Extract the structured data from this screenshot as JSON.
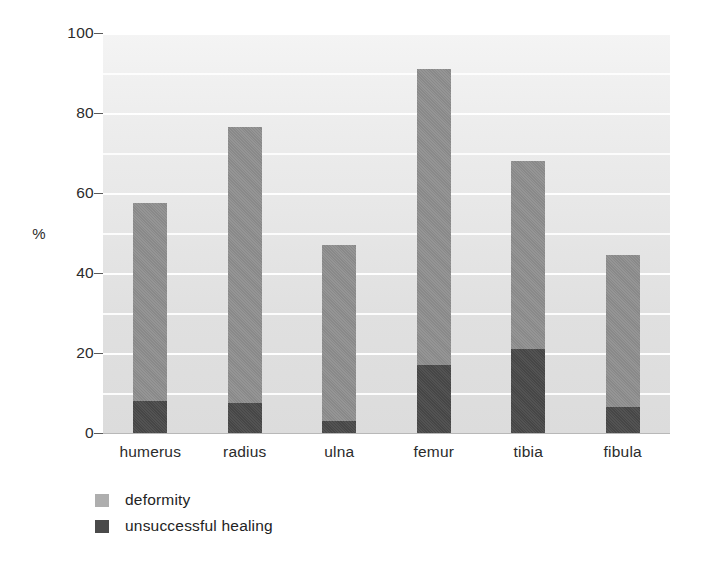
{
  "chart_data": {
    "type": "bar",
    "subtype": "stacked",
    "title": "",
    "xlabel": "",
    "ylabel": "%",
    "ylim": [
      0,
      100
    ],
    "yticks": [
      0,
      20,
      40,
      60,
      80,
      100
    ],
    "ytick_labels": [
      "0",
      "20",
      "40",
      "60",
      "80",
      "100"
    ],
    "grid": true,
    "grid_interval": 10,
    "legend_position": "bottom-left",
    "categories": [
      "humerus",
      "radius",
      "ulna",
      "femur",
      "tibia",
      "fibula"
    ],
    "series": [
      {
        "name": "deformity",
        "color": "#8d8d8d",
        "values": [
          57.5,
          76.5,
          47.0,
          91.0,
          68.0,
          44.5
        ]
      },
      {
        "name": "unsuccessful healing",
        "color": "#4a4a4a",
        "values": [
          8.0,
          7.5,
          3.0,
          17.0,
          21.0,
          6.5
        ]
      }
    ]
  },
  "axis": {
    "y_title": "%",
    "y_labels": [
      "100",
      "80",
      "60",
      "40",
      "20",
      "0"
    ]
  },
  "legend": {
    "items": [
      {
        "label": "deformity",
        "swatch": "light-gray-swatch"
      },
      {
        "label": "unsuccessful healing",
        "swatch": "dark-gray-swatch"
      }
    ]
  },
  "categories": [
    "humerus",
    "radius",
    "ulna",
    "femur",
    "tibia",
    "fibula"
  ]
}
